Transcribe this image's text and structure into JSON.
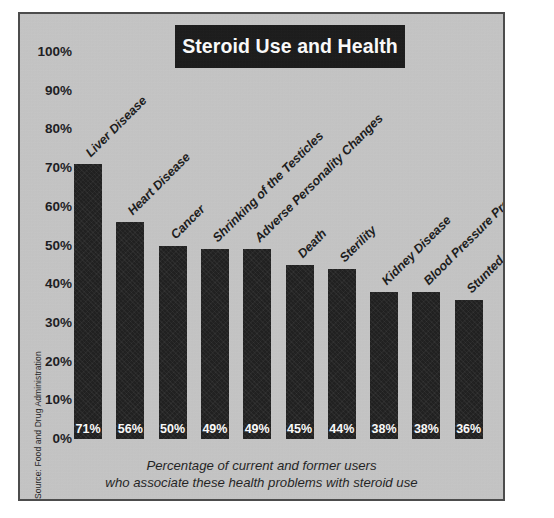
{
  "chart_data": {
    "type": "bar",
    "title": "Steroid Use and Health",
    "categories": [
      "Liver Disease",
      "Heart Disease",
      "Cancer",
      "Shrinking of the Testicles",
      "Adverse Personality Changes",
      "Death",
      "Sterility",
      "Kidney Disease",
      "Blood Pressure Problems",
      "Stunted Growth"
    ],
    "values": [
      71,
      56,
      50,
      49,
      49,
      45,
      44,
      38,
      38,
      36
    ],
    "value_labels": [
      "71%",
      "56%",
      "50%",
      "49%",
      "49%",
      "45%",
      "44%",
      "38%",
      "38%",
      "36%"
    ],
    "xlabel": "",
    "ylabel": "",
    "ylim": [
      0,
      100
    ],
    "y_ticks": [
      100,
      90,
      80,
      70,
      60,
      50,
      40,
      30,
      20,
      10,
      0
    ],
    "y_tick_labels": [
      "100%",
      "90%",
      "80%",
      "70%",
      "60%",
      "50%",
      "40%",
      "30%",
      "20%",
      "10%",
      "0%"
    ],
    "grid": false,
    "legend": false,
    "bar_color": "#191919",
    "background_color": "#c6c6c6",
    "title_background_color": "#151515",
    "title_text_color": "#ffffff"
  },
  "caption": {
    "line1": "Percentage of current and former users",
    "line2": "who associate these health problems with steroid use"
  },
  "source": {
    "text": "Source: Food and Drug Administration"
  }
}
